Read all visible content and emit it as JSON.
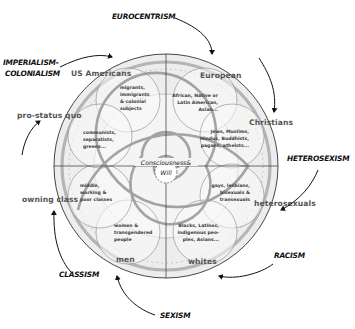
{
  "diagram": {
    "center": {
      "line1": "Consciousness&",
      "line2": "Will"
    },
    "oppressions": [
      {
        "id": "eurocentrism",
        "label": "EUROCENTRISM"
      },
      {
        "id": "imperialism",
        "line1": "IMPERIALISM-",
        "line2": "COLONIALISM"
      },
      {
        "id": "heterosexism",
        "label": "HETEROSEXISM"
      },
      {
        "id": "racism",
        "label": "RACISM"
      },
      {
        "id": "sexism",
        "label": "SEXISM"
      },
      {
        "id": "classism",
        "label": "CLASSISM"
      }
    ],
    "dominant_groups": {
      "us_americans": "US Americans",
      "european": "European",
      "christians": "Christians",
      "heterosexuals": "heterosexuals",
      "whites": "whites",
      "men": "men",
      "owning_class": "owning class",
      "pro_status_quo": "pro-status quo"
    },
    "targeted_groups": {
      "migrants": [
        "migrants,",
        "immigrants",
        "& colonial",
        "subjects"
      ],
      "african": [
        "African, Native or",
        "Latin American,",
        "Asian..."
      ],
      "jews": [
        "Jews, Muslims,",
        "Hindus, Buddhists,",
        "pagans, atheists..."
      ],
      "gays": [
        "gays, lesbians,",
        "bisexuals &",
        "transexuals"
      ],
      "blacks": [
        "Blacks, Latinos,",
        "indigenous peo-",
        "ples, Asians..."
      ],
      "women": [
        "women &",
        "transgendered",
        "people"
      ],
      "middle": [
        "middle,",
        "working &",
        "poor classes"
      ],
      "communists": [
        "communists,",
        "separatists,",
        "greens..."
      ]
    },
    "colors": {
      "wheel_fill": "#ececec",
      "inner_fill": "#f6f6f6",
      "spiral": "#9a9a9a",
      "lines": "#333333",
      "group_text": "#555555"
    }
  }
}
